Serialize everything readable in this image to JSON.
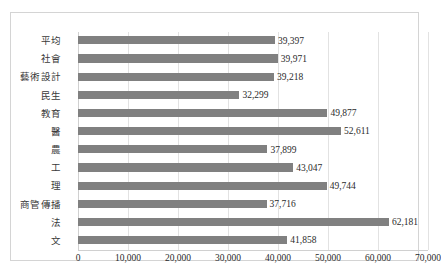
{
  "chart_data": {
    "type": "bar",
    "orientation": "horizontal",
    "title": "",
    "subtitle": "",
    "xlabel": "",
    "ylabel": "",
    "xlim": [
      0,
      70000
    ],
    "grid": true,
    "legend": false,
    "series_color": "#808080",
    "categories": [
      "平均",
      "社會",
      "藝術設計",
      "民生",
      "教育",
      "醫",
      "農",
      "工",
      "理",
      "商管傳播",
      "法",
      "文"
    ],
    "values": [
      39397,
      39971,
      39218,
      32299,
      49877,
      52611,
      37899,
      43047,
      49744,
      37716,
      62181,
      41858
    ],
    "value_labels": [
      "39,397",
      "39,971",
      "39,218",
      "32,299",
      "49,877",
      "52,611",
      "37,899",
      "43,047",
      "49,744",
      "37,716",
      "62,181",
      "41,858"
    ],
    "xticks": [
      0,
      10000,
      20000,
      30000,
      40000,
      50000,
      60000,
      70000
    ],
    "xtick_labels": [
      "0",
      "10,000",
      "20,000",
      "30,000",
      "40,000",
      "50,000",
      "60,000",
      "70,000"
    ]
  }
}
